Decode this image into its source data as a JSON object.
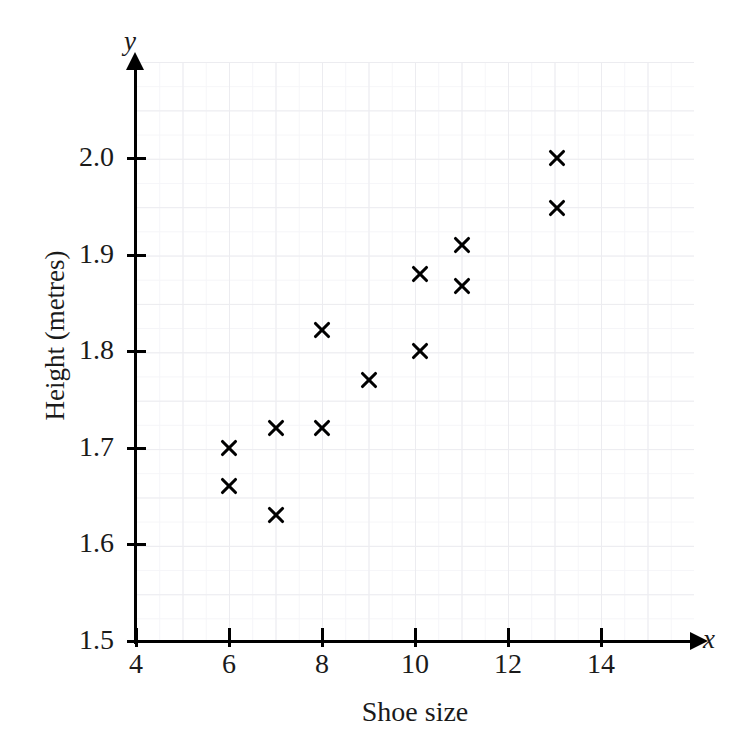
{
  "chart_data": {
    "type": "scatter",
    "title": "Scatter graph",
    "xlabel": "Shoe size",
    "ylabel": "Height (metres)",
    "x_axis_var": "x",
    "y_axis_var": "y",
    "xlim": [
      4,
      15
    ],
    "ylim": [
      1.5,
      2.05
    ],
    "xticks": [
      4,
      6,
      8,
      10,
      12,
      14
    ],
    "xtick_labels": [
      "4",
      "6",
      "8",
      "10",
      "12",
      "14"
    ],
    "yticks": [
      1.5,
      1.6,
      1.7,
      1.8,
      1.9,
      2.0
    ],
    "ytick_labels": [
      "1.5",
      "1.6",
      "1.7",
      "1.8",
      "1.9",
      "2.0"
    ],
    "grid": true,
    "grid_color": "#ececf0",
    "marker": "x",
    "marker_color": "#000000",
    "legend": null,
    "points": [
      {
        "x": 6.0,
        "y": 1.7
      },
      {
        "x": 6.0,
        "y": 1.66
      },
      {
        "x": 7.0,
        "y": 1.72
      },
      {
        "x": 7.0,
        "y": 1.63
      },
      {
        "x": 8.0,
        "y": 1.822
      },
      {
        "x": 8.0,
        "y": 1.72
      },
      {
        "x": 9.0,
        "y": 1.77
      },
      {
        "x": 10.1,
        "y": 1.88
      },
      {
        "x": 10.1,
        "y": 1.8
      },
      {
        "x": 11.0,
        "y": 1.91
      },
      {
        "x": 11.0,
        "y": 1.868
      },
      {
        "x": 13.05,
        "y": 2.0
      },
      {
        "x": 13.05,
        "y": 1.948
      }
    ]
  }
}
